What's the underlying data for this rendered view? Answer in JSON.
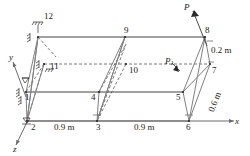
{
  "figure": {
    "type": "3d-space-frame-diagram",
    "colors": {
      "member_solid": "#808080",
      "member_dashed": "#555555",
      "axis": "#6b6b6b",
      "text": "#1a1a1a"
    },
    "axes": [
      {
        "name": "x-axis",
        "label": "x",
        "direction": "right"
      },
      {
        "name": "y-axis",
        "label": "y",
        "direction": "upper-left"
      },
      {
        "name": "z-axis",
        "label": "z",
        "direction": "lower-left"
      }
    ],
    "nodes": [
      {
        "id": "1",
        "label": "1"
      },
      {
        "id": "2",
        "label": "2"
      },
      {
        "id": "3",
        "label": "3"
      },
      {
        "id": "4",
        "label": "4"
      },
      {
        "id": "5",
        "label": "5"
      },
      {
        "id": "6",
        "label": "6"
      },
      {
        "id": "7",
        "label": "7"
      },
      {
        "id": "8",
        "label": "8"
      },
      {
        "id": "9",
        "label": "9"
      },
      {
        "id": "10",
        "label": "10"
      },
      {
        "id": "11",
        "label": "11"
      },
      {
        "id": "12",
        "label": "12"
      }
    ],
    "loads": [
      {
        "name": "load-P",
        "label": "P",
        "subscript": ""
      },
      {
        "name": "load-P1",
        "label": "P",
        "subscript": "1"
      }
    ],
    "dimensions": [
      {
        "name": "span-1",
        "label": "0.9 m"
      },
      {
        "name": "span-2",
        "label": "0.9 m"
      },
      {
        "name": "height-top",
        "label": "0.2 m"
      },
      {
        "name": "height-side",
        "label": "0.6 m"
      }
    ],
    "supports": [
      {
        "name": "support-node-12"
      },
      {
        "name": "support-node-11"
      },
      {
        "name": "support-node-1"
      },
      {
        "name": "support-node-2"
      }
    ]
  }
}
